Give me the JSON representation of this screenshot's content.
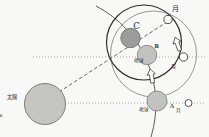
{
  "diagram": {
    "labels": {
      "sun": "太陽",
      "point_c": "C",
      "point_b": "B",
      "point_a": "A",
      "earth_top": "地球",
      "earth_bottom": "地球",
      "moon_top": "月",
      "moon_right": "月",
      "moon_bottom": "月"
    },
    "colors": {
      "background": "#f8f8f6",
      "sun_fill": "#c5c5c2",
      "sun_stroke": "#7d7d7b",
      "dark_body_fill": "#9c9c9a",
      "dark_body_stroke": "#6c6c6a",
      "earth_fill": "#c2c2c0",
      "earth_stroke": "#858583",
      "moon_fill": "#ffffff",
      "moon_stroke": "#3d3d3d",
      "orbit_line": "#4a4a48",
      "heavy_circle": "#2c2c2a",
      "light_circle": "#767674",
      "dotted_line": "#8a8a88",
      "dashed_line": "#3f3f3d"
    }
  }
}
